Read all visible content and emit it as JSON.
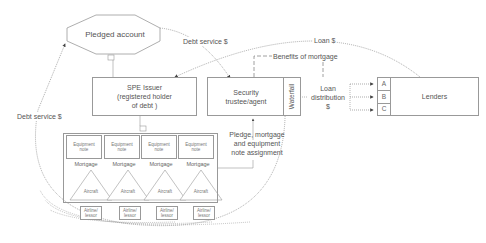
{
  "diagram": {
    "type": "structured-finance-flow",
    "nodes": {
      "pledged_account": "Pledged account",
      "spe_issuer": [
        "SPE Issuer",
        "(registered holder",
        "of debt )"
      ],
      "security_trustee": [
        "Security",
        "trustee/agent"
      ],
      "waterfall": "Waterfall",
      "lenders": "Lenders",
      "tranches": [
        "A",
        "B",
        "C"
      ],
      "equipment_note": [
        "Equipment",
        "note"
      ],
      "mortgage": "Mortgage",
      "aircraft": "Aircraft",
      "airline_lessor": [
        "Airline/",
        "lessor"
      ]
    },
    "edge_labels": {
      "debt_service_top": "Debt service $",
      "debt_service_left": "Debt service $",
      "loan": "Loan $",
      "benefits": "Benefits of mortgage",
      "loan_distribution": [
        "Loan",
        "distribution",
        "$"
      ],
      "pledge": [
        "Pledge, mortgage",
        "and equipment",
        "note assignment"
      ]
    },
    "groups": 4
  }
}
